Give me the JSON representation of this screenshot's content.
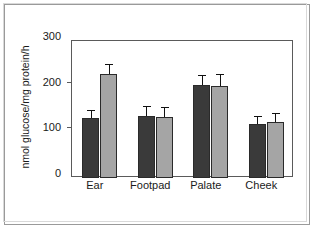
{
  "chart_data": {
    "type": "bar",
    "title": "",
    "subtitle": "",
    "xlabel": "",
    "ylabel": "nmol glucose/mg protein/h",
    "categories": [
      "Ear",
      "Footpad",
      "Palate",
      "Cheek"
    ],
    "series": [
      {
        "name": "dark",
        "color": "#3a3a3a",
        "values": [
          131,
          136,
          204,
          119
        ],
        "errors": [
          18,
          21,
          22,
          16
        ]
      },
      {
        "name": "gray",
        "color": "#a5a5a5",
        "values": [
          228,
          134,
          201,
          122
        ],
        "errors": [
          22,
          21,
          26,
          20
        ]
      }
    ],
    "ylim": [
      0,
      300
    ],
    "yticks": [
      0,
      100,
      200,
      300
    ],
    "ytick_labels": [
      "0",
      "100",
      "200",
      "300"
    ],
    "grid": false,
    "legend": false,
    "legend_position": "none",
    "error_bar_style": "upper-only-caps",
    "axis_frame": "full-box"
  },
  "colors": {
    "dark_bar": "#3a3a3a",
    "gray_bar": "#a5a5a5",
    "bar_edge": "#2a2a2a",
    "axis": "#5a5a5a",
    "text": "#1a1a1a",
    "outer_frame": "#9a9a9a",
    "background": "#ffffff"
  }
}
